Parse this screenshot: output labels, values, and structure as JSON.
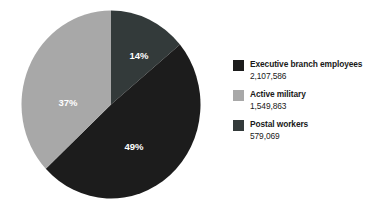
{
  "chart_data": {
    "type": "pie",
    "title": "",
    "subtitle": "",
    "xlabel": "",
    "ylabel": "",
    "legend_position": "right",
    "grid": false,
    "start_angle_deg": 0,
    "direction": "clockwise",
    "categories": [
      "Executive branch employees",
      "Active military",
      "Postal workers"
    ],
    "values": [
      2107586,
      1549863,
      579069
    ],
    "value_labels": [
      "2,107,586",
      "1,549,863",
      "579,069"
    ],
    "percentages": [
      49,
      37,
      14
    ],
    "percent_labels": [
      "49%",
      "37%",
      "14%"
    ],
    "colors": [
      "#1c1c1c",
      "#a8a8a8",
      "#333a3a"
    ],
    "slices": [
      {
        "name": "postal-workers",
        "label": "Postal workers",
        "value": 579069,
        "value_label": "579,069",
        "percent": 14,
        "percent_label": "14%",
        "color": "#333a3a",
        "start_deg": 0,
        "end_deg": 50.4
      },
      {
        "name": "executive-branch-employees",
        "label": "Executive branch employees",
        "value": 2107586,
        "value_label": "2,107,586",
        "percent": 49,
        "percent_label": "49%",
        "color": "#1c1c1c",
        "start_deg": 50.4,
        "end_deg": 226.8
      },
      {
        "name": "active-military",
        "label": "Active military",
        "value": 1549863,
        "value_label": "1,549,863",
        "percent": 37,
        "percent_label": "37%",
        "color": "#a8a8a8",
        "start_deg": 226.8,
        "end_deg": 360
      }
    ]
  },
  "legend": {
    "items": [
      {
        "label": "Executive branch employees",
        "value": "2,107,586",
        "color": "#1c1c1c",
        "swatch_name": "legend-swatch-executive-branch-employees"
      },
      {
        "label": "Active military",
        "value": "1,549,863",
        "color": "#a8a8a8",
        "swatch_name": "legend-swatch-active-military"
      },
      {
        "label": "Postal workers",
        "value": "579,069",
        "color": "#333a3a",
        "swatch_name": "legend-swatch-postal-workers"
      }
    ]
  },
  "pie_labels": {
    "postal": "14%",
    "military": "37%",
    "executive": "49%"
  },
  "colors": {
    "background": "#ffffff",
    "text": "#1a1a1a",
    "slice_label_text": "#ffffff",
    "executive": "#1c1c1c",
    "military": "#a8a8a8",
    "postal": "#333a3a"
  }
}
